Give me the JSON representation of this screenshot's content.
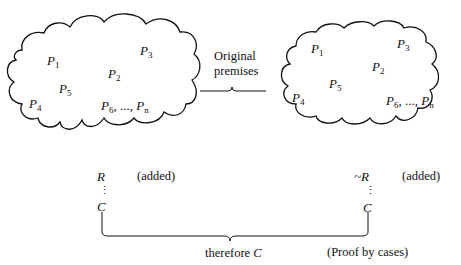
{
  "left_cloud": {
    "premises": [
      {
        "base": "P",
        "sub": "1"
      },
      {
        "base": "P",
        "sub": "2"
      },
      {
        "base": "P",
        "sub": "3"
      },
      {
        "base": "P",
        "sub": "4"
      },
      {
        "base": "P",
        "sub": "5"
      }
    ],
    "range": {
      "a_base": "P",
      "a_sub": "6",
      "sep": ", ..., ",
      "b_base": "P",
      "b_sub": "n"
    }
  },
  "right_cloud": {
    "premises": [
      {
        "base": "P",
        "sub": "1"
      },
      {
        "base": "P",
        "sub": "2"
      },
      {
        "base": "P",
        "sub": "3"
      },
      {
        "base": "P",
        "sub": "4"
      },
      {
        "base": "P",
        "sub": "5"
      }
    ],
    "range": {
      "a_base": "P",
      "a_sub": "6",
      "sep": ", ..., ",
      "b_base": "P",
      "b_sub": "n"
    }
  },
  "middle_label": {
    "line1": "Original",
    "line2": "premises"
  },
  "left_case": {
    "assumption": "R",
    "note": "(added)",
    "dots": "⋮",
    "conclusion": "C"
  },
  "right_case": {
    "assumption": "~R",
    "note": "(added)",
    "dots": "⋮",
    "conclusion": "C"
  },
  "bottom": {
    "therefore_text": "therefore",
    "therefore_var": "C",
    "method": "(Proof by cases)"
  }
}
